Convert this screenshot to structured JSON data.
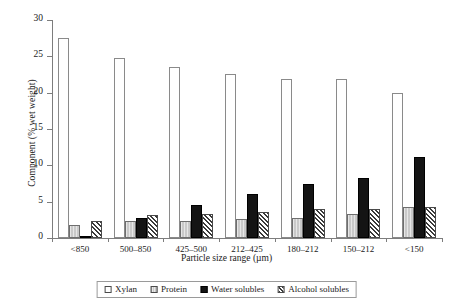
{
  "chart_data": {
    "type": "bar",
    "title": "",
    "xlabel": "Particle size range (µm)",
    "ylabel": "Component (% wet weight)",
    "categories": [
      "<850",
      "500–850",
      "425–500",
      "212–425",
      "180–212",
      "150–212",
      "<150"
    ],
    "series": [
      {
        "name": "Xylan",
        "values": [
          27.5,
          24.8,
          23.5,
          22.6,
          21.9,
          21.9,
          20.0
        ]
      },
      {
        "name": "Protein",
        "values": [
          1.8,
          2.3,
          2.3,
          2.6,
          2.8,
          3.3,
          4.2
        ]
      },
      {
        "name": "Water solubles",
        "values": [
          0.1,
          2.8,
          4.5,
          6.0,
          7.5,
          8.3,
          11.2
        ]
      },
      {
        "name": "Alcohol solubles",
        "values": [
          2.3,
          3.1,
          3.3,
          3.6,
          4.0,
          4.0,
          4.3
        ]
      }
    ],
    "ylim": [
      0,
      30
    ],
    "yticks": [
      0,
      5,
      10,
      15,
      20,
      25,
      30
    ],
    "grid": false,
    "legend_position": "bottom",
    "colors": {
      "xylan": "#ffffff",
      "protein": "#c9c9c9",
      "water_solubles": "#141414",
      "alcohol_solubles": "#3a3a3a",
      "axis": "#7d7d7d",
      "text": "#1a1a1a"
    }
  },
  "legend": {
    "items": [
      {
        "label": "Xylan",
        "swatch": "empty-square-swatch"
      },
      {
        "label": "Protein",
        "swatch": "light-gray-square-swatch"
      },
      {
        "label": "Water solubles",
        "swatch": "black-square-swatch"
      },
      {
        "label": "Alcohol solubles",
        "swatch": "hatched-square-swatch"
      }
    ]
  }
}
